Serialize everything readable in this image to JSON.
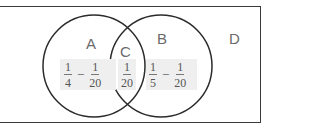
{
  "diagram": {
    "type": "venn",
    "universe_label": "D",
    "sets": [
      {
        "label": "A",
        "region_expr": {
          "a_num": "1",
          "a_den": "4",
          "op": "−",
          "b_num": "1",
          "b_den": "20"
        }
      },
      {
        "label": "B",
        "region_expr": {
          "a_num": "1",
          "a_den": "5",
          "op": "−",
          "b_num": "1",
          "b_den": "20"
        }
      }
    ],
    "intersection": {
      "label": "C",
      "num": "1",
      "den": "20"
    },
    "colors": {
      "stroke": "#2b2b2b",
      "label": "#6b6b6b",
      "shade": "#efefef"
    }
  }
}
